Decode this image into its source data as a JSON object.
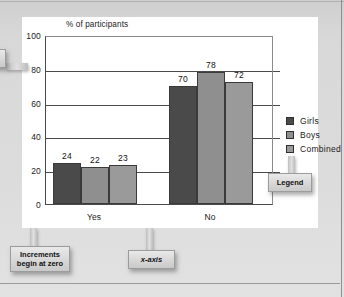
{
  "chart_data": {
    "type": "bar",
    "title": "% of participants",
    "xlabel": "",
    "ylabel": "% of participants",
    "categories": [
      "Yes",
      "No"
    ],
    "series": [
      {
        "name": "Girls",
        "values": [
          24,
          70
        ],
        "color": "#4a4a4a"
      },
      {
        "name": "Boys",
        "values": [
          22,
          78
        ],
        "color": "#8f8f8f"
      },
      {
        "name": "Combined",
        "values": [
          23,
          72
        ],
        "color": "#9a9a9a"
      }
    ],
    "ylim": [
      0,
      100
    ],
    "yticks": [
      100,
      80,
      60,
      40,
      20,
      0
    ],
    "grid": true,
    "legend_position": "right"
  },
  "legend": {
    "items": [
      {
        "label": "Girls",
        "color": "#4a4a4a"
      },
      {
        "label": "Boys",
        "color": "#8f8f8f"
      },
      {
        "label": "Combined",
        "color": "#9a9a9a"
      }
    ]
  },
  "callouts": {
    "increments": "Increments begin at zero",
    "xaxis": "x-axis",
    "yaxis": "y-axis",
    "legend": "Legend"
  },
  "colors": {
    "page_background": "#dcdcdc",
    "card_background": "#ffffff",
    "axis": "#4a4a4a",
    "text": "#1a1a1a",
    "callout_fill": "#dcdcdc"
  }
}
